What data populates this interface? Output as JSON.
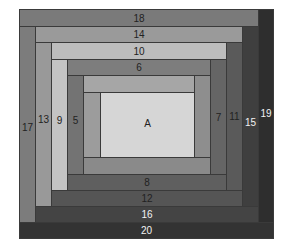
{
  "diagram": {
    "center": {
      "label": "A",
      "color": "#d6d6d6"
    },
    "strips": [
      {
        "id": "s1",
        "label": "",
        "side": "top",
        "color": "#a6a6a6"
      },
      {
        "id": "s2",
        "label": "",
        "side": "left",
        "color": "#9c9c9c"
      },
      {
        "id": "s3",
        "label": "",
        "side": "bottom",
        "color": "#8a8a8a"
      },
      {
        "id": "s4",
        "label": "",
        "side": "right",
        "color": "#8e8e8e"
      },
      {
        "id": "s5",
        "label": "5",
        "side": "left",
        "color": "#737373"
      },
      {
        "id": "s6",
        "label": "6",
        "side": "top",
        "color": "#7d7d7d"
      },
      {
        "id": "s7",
        "label": "7",
        "side": "right",
        "color": "#656565"
      },
      {
        "id": "s8",
        "label": "8",
        "side": "bottom",
        "color": "#5f5f5f"
      },
      {
        "id": "s9",
        "label": "9",
        "side": "left",
        "color": "#c4c4c4"
      },
      {
        "id": "s10",
        "label": "10",
        "side": "top",
        "color": "#bdbdbd"
      },
      {
        "id": "s11",
        "label": "11",
        "side": "right",
        "color": "#5a5a5a"
      },
      {
        "id": "s12",
        "label": "12",
        "side": "bottom",
        "color": "#555555"
      },
      {
        "id": "s13",
        "label": "13",
        "side": "left",
        "color": "#999999"
      },
      {
        "id": "s14",
        "label": "14",
        "side": "top",
        "color": "#9a9a9a"
      },
      {
        "id": "s15",
        "label": "15",
        "side": "right",
        "color": "#3f3f3f"
      },
      {
        "id": "s16",
        "label": "16",
        "side": "bottom",
        "color": "#444444"
      },
      {
        "id": "s17",
        "label": "17",
        "side": "left",
        "color": "#7c7c7c"
      },
      {
        "id": "s18",
        "label": "18",
        "side": "top",
        "color": "#7a7a7a"
      },
      {
        "id": "s19",
        "label": "19",
        "side": "right",
        "color": "#2e2e2e"
      },
      {
        "id": "s20",
        "label": "20",
        "side": "bottom",
        "color": "#333333"
      }
    ]
  }
}
